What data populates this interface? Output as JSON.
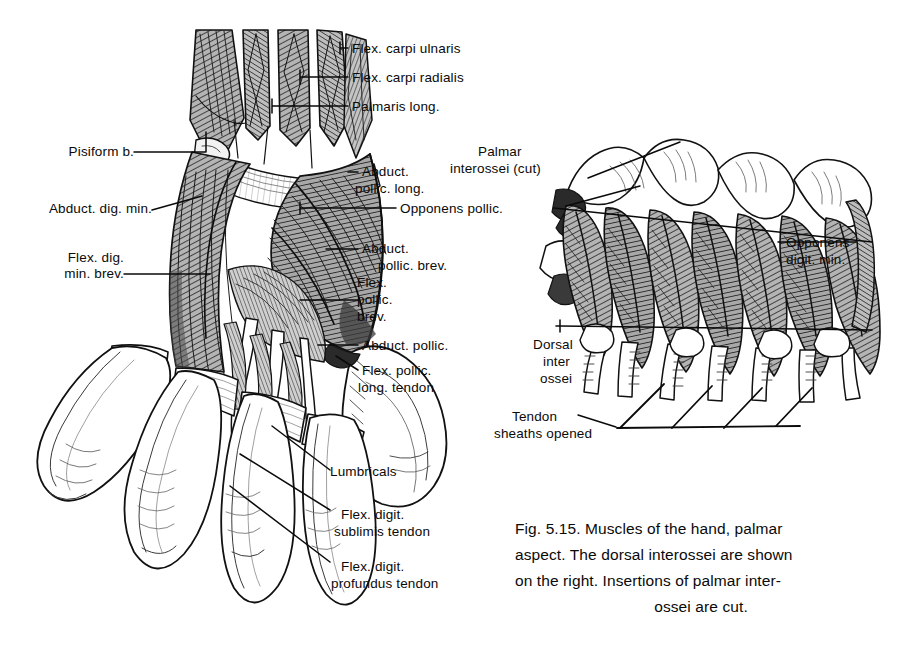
{
  "figure": {
    "number": "Fig. 5.15.",
    "caption_lines": [
      "Fig. 5.15. Muscles of the hand, palmar",
      "aspect. The dorsal interossei are shown",
      "on the right. Insertions of palmar inter-",
      "ossei are cut."
    ],
    "caption_full": "Fig. 5.15. Muscles of the hand, palmar aspect. The dorsal interossei are shown on the right. Insertions of palmar interossei are cut."
  },
  "left_figure": {
    "name": "palmar-aspect-hand",
    "labels": [
      {
        "id": "flex-carpi-ulnaris",
        "lines": [
          "Flex. carpi ulnaris"
        ]
      },
      {
        "id": "flex-carpi-radialis",
        "lines": [
          "Flex. carpi radialis"
        ]
      },
      {
        "id": "palmaris-longus",
        "lines": [
          "Palmaris long."
        ]
      },
      {
        "id": "pisiform-bone",
        "lines": [
          "Pisiform b."
        ]
      },
      {
        "id": "abductor-digiti-minimi",
        "lines": [
          "Abduct. dig. min."
        ]
      },
      {
        "id": "flex-dig-min-brevis",
        "lines": [
          "Flex. dig.",
          "min. brev."
        ]
      },
      {
        "id": "abductor-pollicis-longus",
        "lines": [
          "Abduct.",
          "pollic. long."
        ]
      },
      {
        "id": "opponens-pollicis",
        "lines": [
          "Opponens pollic."
        ]
      },
      {
        "id": "abductor-pollicis-brevis",
        "lines": [
          "Abduct.",
          "pollic. brev."
        ]
      },
      {
        "id": "flexor-pollicis-brevis",
        "lines": [
          "Flex.",
          "pollic.",
          "brev."
        ]
      },
      {
        "id": "adductor-pollicis",
        "lines": [
          "Abduct. pollic."
        ]
      },
      {
        "id": "flex-pollicis-longus-tendon",
        "lines": [
          "Flex. pollic.",
          "long. tendon"
        ]
      },
      {
        "id": "lumbricals",
        "lines": [
          "Lumbricals"
        ]
      },
      {
        "id": "flex-digit-sublimis-tendon",
        "lines": [
          "Flex. digit.",
          "sublimis tendon"
        ]
      },
      {
        "id": "flex-digit-profundus-tendon",
        "lines": [
          "Flex. digit.",
          "profundus tendon"
        ]
      }
    ]
  },
  "right_figure": {
    "name": "dorsal-interossei-hand",
    "labels": [
      {
        "id": "palmar-interossei-cut",
        "lines": [
          "Palmar",
          "interossei (cut)"
        ]
      },
      {
        "id": "opponens-digiti-minimi",
        "lines": [
          "Opponens",
          "digit. min."
        ]
      },
      {
        "id": "dorsal-interossei",
        "lines": [
          "Dorsal",
          "inter",
          "ossei"
        ]
      },
      {
        "id": "tendon-sheaths-opened",
        "lines": [
          "Tendon",
          "sheaths opened"
        ]
      }
    ]
  },
  "colors": {
    "ink": "#0a0a0a",
    "paper": "#ffffff",
    "muscle_mid": "#8d8d8d",
    "muscle_dark": "#4a4a4a",
    "muscle_light": "#c9c9c9"
  }
}
